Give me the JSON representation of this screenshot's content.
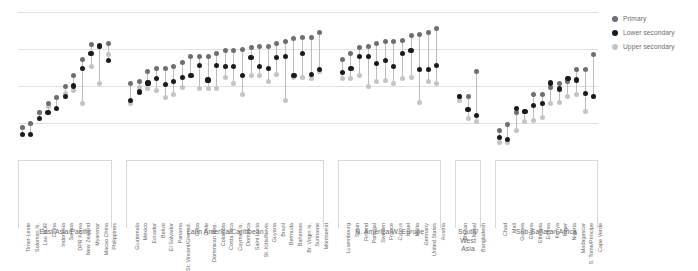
{
  "legend": {
    "position": "top-right",
    "items": [
      {
        "key": "primary",
        "label": "Primary",
        "color": "#6f6f6f"
      },
      {
        "key": "lower",
        "label": "Lower secondary",
        "color": "#1b1b1b"
      },
      {
        "key": "upper",
        "label": "Upper secondary",
        "color": "#c4c4c4"
      }
    ]
  },
  "chart_data": {
    "type": "scatter",
    "subtype": "dumbbell",
    "title": "",
    "subtitle": "",
    "xlabel": "",
    "ylabel": "",
    "ylim": [
      0,
      100
    ],
    "grid": true,
    "gridlines": [
      25,
      50,
      75,
      100
    ],
    "legend_position": "top-right",
    "series_names": [
      "Primary",
      "Lower secondary",
      "Upper secondary"
    ],
    "series_colors": [
      "#6f6f6f",
      "#1b1b1b",
      "#c4c4c4"
    ],
    "groups": [
      {
        "name": "East Asia/Pacific",
        "label": "East Asia/Pacific",
        "categories": [
          "Timor-Leste",
          "Solomon Is.",
          "Lao PDR",
          "China",
          "Indonesia",
          "Samoa",
          "DPR Korea",
          "New Zealand",
          "Myanmar",
          "Macao China",
          "Philippines"
        ],
        "primary": [
          22,
          25,
          32,
          38,
          42,
          50,
          57,
          68,
          78,
          77,
          79
        ],
        "lower_secondary": [
          17,
          17,
          28,
          32,
          35,
          43,
          50,
          62,
          72,
          77,
          67
        ],
        "upper_secondary": [
          22,
          25,
          32,
          36,
          42,
          45,
          47,
          38,
          63,
          52,
          71
        ]
      },
      {
        "name": "Latin America/Caribbean",
        "label": "Latin America/Caribbean",
        "categories": [
          "Guatemala",
          "Mexico",
          "Ecuador",
          "Belize",
          "El Salvador",
          "Panama",
          "St. Vincent/Grenad.",
          "Cuba",
          "Chile",
          "Dominican Rep.",
          "Colombia",
          "Costa Rica",
          "Cayman Is.",
          "Dominica",
          "Saint Lucia",
          "St. Kitts/Nevis",
          "Guyana",
          "Brazil",
          "Bermuda",
          "Bahamas",
          "Br. Virgin Is.",
          "Suriname",
          "Montserrat"
        ],
        "primary": [
          52,
          53,
          60,
          62,
          62,
          63,
          66,
          70,
          70,
          70,
          72,
          74,
          74,
          75,
          76,
          77,
          77,
          79,
          80,
          82,
          83,
          83,
          86
        ],
        "lower_secondary": [
          40,
          46,
          52,
          55,
          51,
          53,
          56,
          57,
          64,
          54,
          64,
          63,
          63,
          57,
          69,
          63,
          62,
          69,
          70,
          57,
          72,
          58,
          61
        ],
        "upper_secondary": [
          38,
          49,
          48,
          47,
          42,
          44,
          49,
          57,
          48,
          48,
          48,
          56,
          52,
          44,
          57,
          57,
          53,
          58,
          40,
          56,
          56,
          55,
          60
        ]
      },
      {
        "name": "N. America/W. Europe",
        "label": "N. America/W. Europe",
        "categories": [
          "Luxembourg",
          "Spain",
          "Finland",
          "Portugal",
          "Sweden",
          "France",
          "Cyprus",
          "Israel",
          "Malta",
          "Germany",
          "United States",
          "Austria"
        ],
        "primary": [
          68,
          72,
          76,
          77,
          79,
          80,
          80,
          81,
          84,
          85,
          86,
          89
        ],
        "lower_secondary": [
          59,
          62,
          70,
          70,
          65,
          67,
          63,
          72,
          74,
          61,
          61,
          64
        ],
        "upper_secondary": [
          55,
          55,
          57,
          50,
          53,
          54,
          52,
          55,
          56,
          39,
          53,
          52
        ]
      },
      {
        "name": "South/West Asia",
        "label": "South/\nWest Asia",
        "categories": [
          "Bhutan",
          "Nepal",
          "Bangladesh"
        ],
        "primary": [
          43,
          43,
          60
        ],
        "lower_secondary": [
          43,
          34,
          30
        ],
        "upper_secondary": [
          40,
          28,
          26
        ]
      },
      {
        "name": "Sub-Saharan Africa",
        "label": "Sub-Saharan Africa",
        "categories": [
          "Chad",
          "Mali",
          "Guinea",
          "Ghana",
          "Ethiopia",
          "Eritrea",
          "Kenya",
          "Niger",
          "Nigeria",
          "Madagascar",
          "S. Tome/Principe",
          "Cape Verde"
        ],
        "primary": [
          20,
          24,
          32,
          33,
          44,
          44,
          49,
          52,
          53,
          61,
          61,
          71
        ],
        "lower_secondary": [
          15,
          14,
          35,
          33,
          37,
          38,
          52,
          48,
          55,
          54,
          45,
          43
        ],
        "upper_secondary": [
          12,
          12,
          20,
          26,
          27,
          29,
          38,
          39,
          43,
          44,
          33,
          43
        ]
      }
    ]
  }
}
